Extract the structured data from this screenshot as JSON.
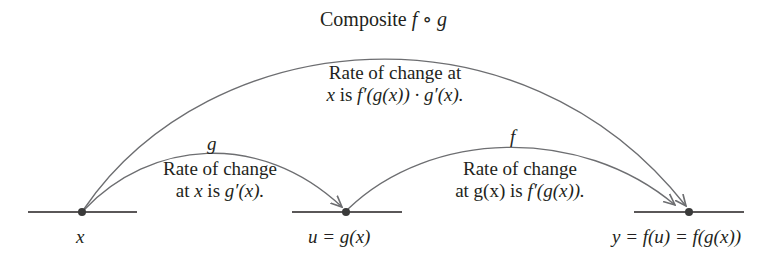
{
  "title": {
    "prefix": "Composite ",
    "f": "f",
    "op": " ∘ ",
    "g": "g"
  },
  "composite_rate": {
    "line1": "Rate of change at",
    "line2": {
      "x": "x",
      "is": " is ",
      "expr": "f′(g(x)) · g′(x)."
    }
  },
  "g_arc": {
    "label": "g",
    "line1": "Rate of change",
    "line2": {
      "at": "at ",
      "x": "x",
      "is": " is ",
      "expr": "g′(x)."
    }
  },
  "f_arc": {
    "label": "f",
    "line1": "Rate of change",
    "line2": {
      "at": "at g(x) is ",
      "expr": "f′(g(x))."
    }
  },
  "points": {
    "x": {
      "label": "x"
    },
    "u": {
      "label": "u = g(x)"
    },
    "y": {
      "label": "y = f(u) = f(g(x))"
    }
  },
  "colors": {
    "line": "#231f20",
    "arc": "#6d6e71",
    "dot": "#3a3a3a"
  }
}
